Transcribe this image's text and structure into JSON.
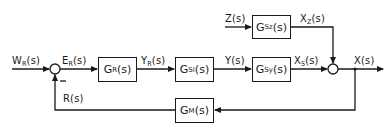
{
  "diagram": {
    "type": "control-loop block diagram",
    "blocks": [
      {
        "id": "GR",
        "base": "G",
        "sub": "R",
        "arg": "(s)"
      },
      {
        "id": "GSI",
        "base": "G",
        "sub": "SI",
        "arg": "(s)"
      },
      {
        "id": "GSY",
        "base": "G",
        "sub": "Sy",
        "arg": "(s)"
      },
      {
        "id": "GSZ",
        "base": "G",
        "sub": "Sz",
        "arg": "(s)"
      },
      {
        "id": "GM",
        "base": "G",
        "sub": "M",
        "arg": "(s)"
      }
    ],
    "signals": [
      {
        "id": "WR",
        "base": "W",
        "sub": "R",
        "arg": "(s)"
      },
      {
        "id": "ER",
        "base": "E",
        "sub": "R",
        "arg": "(s)"
      },
      {
        "id": "YR",
        "base": "Y",
        "sub": "R",
        "arg": "(s)"
      },
      {
        "id": "Y",
        "base": "Y",
        "sub": "",
        "arg": "(s)"
      },
      {
        "id": "XS",
        "base": "X",
        "sub": "S",
        "arg": "(s)"
      },
      {
        "id": "Z",
        "base": "Z",
        "sub": "",
        "arg": "(s)"
      },
      {
        "id": "XZ",
        "base": "X",
        "sub": "Z",
        "arg": "(s)"
      },
      {
        "id": "X",
        "base": "X",
        "sub": "",
        "arg": "(s)"
      },
      {
        "id": "R",
        "base": "R",
        "sub": "",
        "arg": "(s)"
      }
    ],
    "summing_junctions": [
      {
        "id": "sum1",
        "inputs": [
          "W_R(s) +",
          "R(s) −"
        ],
        "output": "E_R(s)"
      },
      {
        "id": "sum2",
        "inputs": [
          "X_S(s) +",
          "X_Z(s) +"
        ],
        "output": "X(s)"
      }
    ],
    "feedback_sign": "−",
    "connections": [
      "W_R(s) → sum1",
      "sum1 → G_R(s) : E_R(s)",
      "G_R(s) → G_SI(s) : Y_R(s)",
      "G_SI(s) → G_Sy(s) : Y(s)",
      "G_Sy(s) → sum2 : X_S(s)",
      "Z(s) → G_Sz(s)",
      "G_Sz(s) → sum2 : X_Z(s)",
      "sum2 → output : X(s)",
      "X(s) → G_M(s)",
      "G_M(s) → sum1 : R(s)"
    ],
    "colors": {
      "line": "#1a1a1a",
      "background": "#ffffff"
    }
  }
}
